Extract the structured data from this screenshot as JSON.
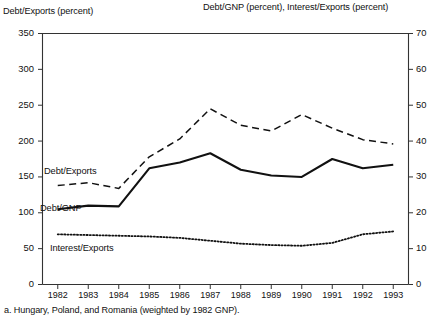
{
  "header": {
    "left_axis_title": "Debt/Exports (percent)",
    "right_axis_title": "Debt/GNP (percent), Interest/Exports (percent)"
  },
  "footnote": "a.  Hungary, Poland, and Romania (weighted by 1982 GNP).",
  "labels": {
    "debt_exports": "Debt/Exports",
    "debt_gnp": "Debt/GNP",
    "interest_exports": "Interest/Exports"
  },
  "colors": {
    "ink": "#111111",
    "axis": "#333333"
  },
  "chart_data": {
    "type": "line",
    "title": "",
    "subtitle": "",
    "xlabel": "",
    "ylabel": "Debt/Exports (percent)",
    "y2label": "Debt/GNP (percent), Interest/Exports (percent)",
    "grid": false,
    "legend": "inline-annotations",
    "categories": [
      "1982",
      "1983",
      "1984",
      "1985",
      "1986",
      "1987",
      "1988",
      "1989",
      "1990",
      "1991",
      "1992",
      "1993"
    ],
    "x": [
      1982,
      1983,
      1984,
      1985,
      1986,
      1987,
      1988,
      1989,
      1990,
      1991,
      1992,
      1993
    ],
    "ylim": [
      0,
      350
    ],
    "yticks": [
      0,
      50,
      100,
      150,
      200,
      250,
      300,
      350
    ],
    "y2lim": [
      0,
      70
    ],
    "y2ticks": [
      0,
      10,
      20,
      30,
      40,
      50,
      60,
      70
    ],
    "series": [
      {
        "name": "Debt/Exports",
        "axis": "left",
        "style": "dashed",
        "unit": "percent",
        "values": [
          138,
          142,
          134,
          178,
          203,
          245,
          222,
          214,
          237,
          218,
          202,
          196
        ]
      },
      {
        "name": "Debt/GNP",
        "axis": "right",
        "style": "solid",
        "unit": "percent",
        "values_left_scale": [
          105,
          110,
          109,
          162,
          170,
          183,
          160,
          152,
          150,
          175,
          162,
          167
        ],
        "values": [
          21.0,
          22.0,
          21.8,
          32.4,
          34.0,
          36.6,
          32.0,
          30.4,
          30.0,
          35.0,
          32.4,
          33.4
        ]
      },
      {
        "name": "Interest/Exports",
        "axis": "right",
        "style": "dotted",
        "unit": "percent",
        "values_left_scale": [
          70,
          69,
          68,
          67,
          65,
          61,
          57,
          55,
          54,
          58,
          70,
          74
        ],
        "values": [
          14.0,
          13.8,
          13.6,
          13.4,
          13.0,
          12.2,
          11.4,
          11.0,
          10.8,
          11.6,
          14.0,
          14.8
        ]
      }
    ]
  }
}
